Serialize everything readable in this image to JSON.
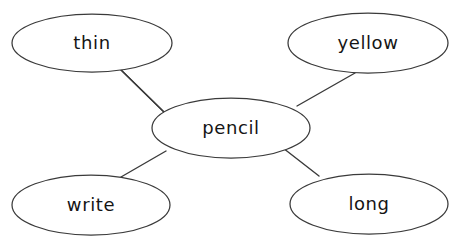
{
  "diagram": {
    "type": "word-web",
    "background_color": "#ffffff",
    "stroke_color": "#3a3a3a",
    "text_color": "#151515",
    "center": {
      "id": "pencil",
      "label": "pencil",
      "cx": 231,
      "cy": 128,
      "rx": 79,
      "ry": 30
    },
    "nodes": [
      {
        "id": "thin",
        "label": "thin",
        "cx": 92,
        "cy": 43,
        "rx": 80,
        "ry": 29
      },
      {
        "id": "yellow",
        "label": "yellow",
        "cx": 368,
        "cy": 43,
        "rx": 80,
        "ry": 30
      },
      {
        "id": "write",
        "label": "write",
        "cx": 91,
        "cy": 205,
        "rx": 79,
        "ry": 30
      },
      {
        "id": "long",
        "label": "long",
        "cx": 369,
        "cy": 204,
        "rx": 79,
        "ry": 30
      }
    ],
    "edges": [
      {
        "id": "edge-pencil-thin",
        "from": "pencil",
        "to": "thin",
        "x1": 165,
        "y1": 113,
        "x2": 119,
        "y2": 68
      },
      {
        "id": "edge-pencil-yellow",
        "from": "pencil",
        "to": "yellow",
        "x1": 297,
        "y1": 106,
        "x2": 355,
        "y2": 73
      },
      {
        "id": "edge-pencil-write",
        "from": "pencil",
        "to": "write",
        "x1": 166,
        "y1": 151,
        "x2": 121,
        "y2": 177
      },
      {
        "id": "edge-pencil-long",
        "from": "pencil",
        "to": "long",
        "x1": 283,
        "y1": 148,
        "x2": 319,
        "y2": 176
      }
    ]
  }
}
